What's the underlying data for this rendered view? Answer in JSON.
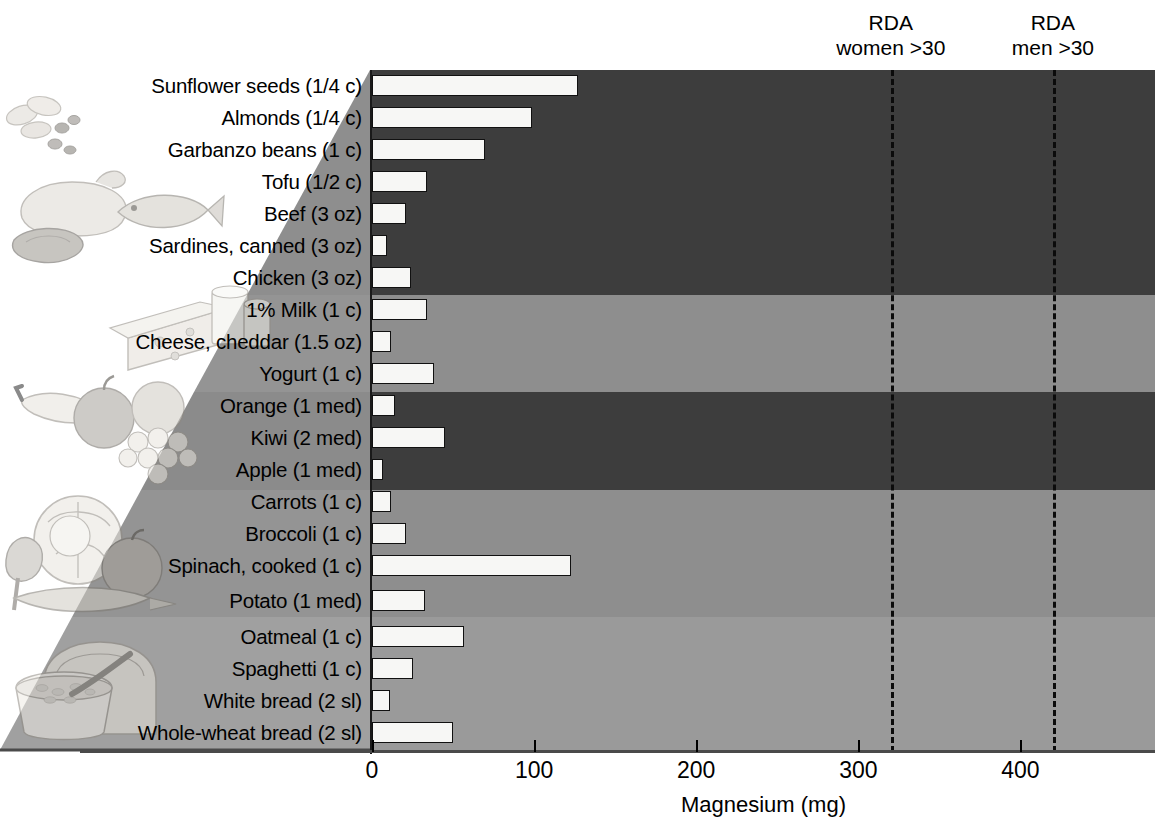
{
  "chart_data": {
    "type": "bar",
    "title": "",
    "xlabel": "Magnesium (mg)",
    "ylabel": "",
    "orientation": "horizontal",
    "xlim": [
      0,
      483
    ],
    "xticks": [
      0,
      100,
      200,
      300,
      400
    ],
    "xticklabels": [
      "0",
      "100",
      "200",
      "300",
      "400"
    ],
    "grid": false,
    "legend": "none",
    "categories": [
      "Sunflower seeds (1/4 c)",
      "Almonds  (1/4 c)",
      "Garbanzo beans (1 c)",
      "Tofu (1/2 c)",
      "Beef (3 oz)",
      "Sardines, canned (3 oz)",
      "Chicken (3 oz)",
      "1% Milk (1 c)",
      "Cheese, cheddar (1.5 oz)",
      "Yogurt (1 c)",
      "Orange (1 med)",
      "Kiwi (2 med)",
      "Apple (1 med)",
      "Carrots (1 c)",
      "Broccoli (1 c)",
      "Spinach, cooked (1 c)",
      "Potato (1 med)",
      "Oatmeal (1 c)",
      "Spaghetti (1 c)",
      "White bread (2 sl)",
      "Whole-wheat bread (2 sl)"
    ],
    "values": [
      127,
      99,
      70,
      34,
      21,
      9,
      24,
      34,
      12,
      38,
      14,
      45,
      7,
      12,
      21,
      123,
      33,
      57,
      25,
      11,
      50
    ],
    "annotations": [
      {
        "label_line1": "RDA",
        "label_line2": "women >30",
        "value": 320
      },
      {
        "label_line1": "RDA",
        "label_line2": "men >30",
        "value": 420
      }
    ],
    "groups": [
      {
        "name": "protein",
        "start_index": 0,
        "end_index": 6,
        "color": "#3d3d3d"
      },
      {
        "name": "dairy",
        "start_index": 7,
        "end_index": 9,
        "color": "#8e8e8e"
      },
      {
        "name": "fruit",
        "start_index": 10,
        "end_index": 12,
        "color": "#3d3d3d"
      },
      {
        "name": "vegetable",
        "start_index": 13,
        "end_index": 16,
        "color": "#8e8e8e"
      },
      {
        "name": "grain",
        "start_index": 17,
        "end_index": 20,
        "color": "#9a9a9a"
      }
    ],
    "bar_fill_color": "#f7f7f5",
    "bar_edge_color": "#111111",
    "rda_line_color": "#0b0b0b"
  },
  "axis": {
    "x_title": "Magnesium (mg)",
    "ticks": [
      "0",
      "100",
      "200",
      "300",
      "400"
    ]
  },
  "rda": {
    "women": {
      "line1": "RDA",
      "line2": "women >30"
    },
    "men": {
      "line1": "RDA",
      "line2": "men >30"
    }
  },
  "art": {
    "nuts_meat": "nuts-meat-fish-illustration",
    "dairy": "cheese-milk-illustration",
    "fruit": "fruit-illustration",
    "vegetable": "vegetable-illustration",
    "grain": "bread-cereal-illustration"
  }
}
